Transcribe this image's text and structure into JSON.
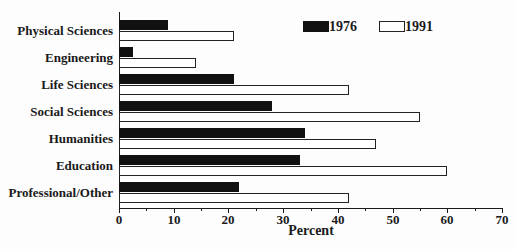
{
  "figure": {
    "background": "#fdfdfd",
    "axis_color": "#1a1a1a",
    "bar_fill_1976": "#111111",
    "bar_fill_1991": "#ffffff"
  },
  "chart_data": {
    "type": "bar",
    "orientation": "horizontal",
    "title": "",
    "xlabel": "Percent",
    "xlim": [
      0,
      70
    ],
    "x_major_ticks": [
      0,
      10,
      20,
      30,
      40,
      50,
      60,
      70
    ],
    "x_minor_ticks": [
      5,
      15,
      25,
      35,
      45,
      55,
      65
    ],
    "grid": false,
    "legend_position": "top-right-inside",
    "categories": [
      "Physical Sciences",
      "Engineering",
      "Life Sciences",
      "Social Sciences",
      "Humanities",
      "Education",
      "Professional/Other"
    ],
    "series": [
      {
        "name": "1976",
        "swatch": "black-filled",
        "color": "#111111",
        "values": [
          9,
          2.5,
          21,
          28,
          34,
          33,
          22
        ]
      },
      {
        "name": "1991",
        "swatch": "white-outlined",
        "color": "#ffffff",
        "values": [
          21,
          14,
          42,
          55,
          47,
          60,
          42
        ]
      }
    ]
  }
}
